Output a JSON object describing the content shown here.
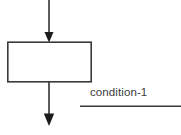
{
  "diagram": {
    "type": "flowchart-fragment",
    "background_color": "#ffffff",
    "stroke_color": "#333333",
    "text_color": "#3a3a3a",
    "process_box": {
      "label": "",
      "x": 7,
      "y": 42,
      "width": 84,
      "height": 40
    },
    "incoming_arrow": {
      "name": "entry-arrow",
      "from_x": 49,
      "from_y": 0,
      "to_x": 49,
      "to_y": 42,
      "direction": "down"
    },
    "outgoing_arrow": {
      "name": "exit-arrow",
      "from_x": 49,
      "from_y": 82,
      "to_x": 49,
      "to_y": 126,
      "direction": "down"
    },
    "annotation": {
      "label": "condition-1",
      "x": 90,
      "y": 85
    },
    "underline": {
      "name": "annotation-underline",
      "x1": 80,
      "x2": 181,
      "y": 106
    }
  }
}
